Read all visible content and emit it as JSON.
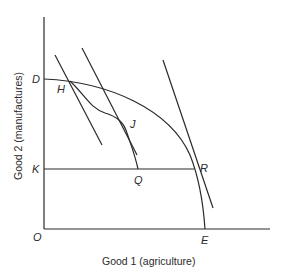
{
  "diagram": {
    "x_axis_title": "Good 1 (agriculture)",
    "y_axis_title": "Good 2 (manufactures)",
    "points": {
      "origin": "O",
      "D": "D",
      "H": "H",
      "J": "J",
      "K": "K",
      "Q": "Q",
      "R": "R",
      "E": "E"
    },
    "curves": [
      {
        "name": "production-possibility-frontier",
        "from": "D",
        "to": "E"
      },
      {
        "name": "inner-curve",
        "from": "H",
        "to": "Q",
        "through": "J"
      }
    ],
    "lines": [
      {
        "name": "price-line-at-H"
      },
      {
        "name": "price-line-at-J"
      },
      {
        "name": "price-line-at-R"
      },
      {
        "name": "horizontal-line-K-R"
      }
    ],
    "colors": {
      "ink": "#2a2a2a",
      "background": "#ffffff"
    }
  }
}
